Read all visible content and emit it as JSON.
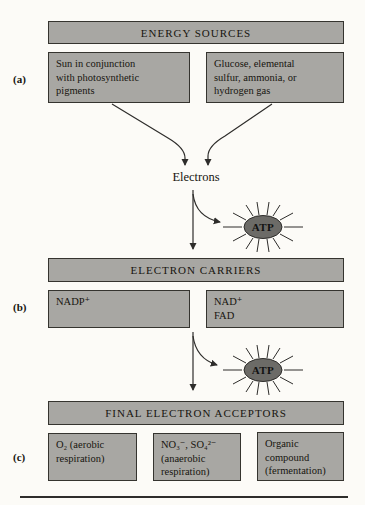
{
  "figure": {
    "type": "flow-diagram",
    "colors": {
      "background": "#fcfbf7",
      "box_fill": "#a8a7a3",
      "box_border": "#35342f",
      "atp_fill": "#6c6b67",
      "line": "#2e2d2b"
    }
  },
  "row_labels": {
    "a": "(a)",
    "b": "(b)",
    "c": "(c)"
  },
  "electrons_label": "Electrons",
  "atp_label": "ATP",
  "sections": {
    "energy_sources": {
      "header": "ENERGY SOURCES",
      "boxes": {
        "light": "Sun in conjunction\nwith photosynthetic\npigments",
        "chemical": "Glucose, elemental\nsulfur, ammonia, or\nhydrogen gas"
      }
    },
    "electron_carriers": {
      "header": "ELECTRON CARRIERS",
      "boxes": {
        "nadp": "NADP⁺",
        "nad_fad": "NAD⁺\nFAD"
      }
    },
    "final_electron_acceptors": {
      "header": "FINAL ELECTRON ACCEPTORS",
      "boxes": {
        "oxygen": "O₂ (aerobic\nrespiration)",
        "anaerobic": "NO₃⁻, SO₄²⁻\n(anaerobic\nrespiration)",
        "organic": "Organic\ncompound\n(fermentation)"
      }
    }
  }
}
